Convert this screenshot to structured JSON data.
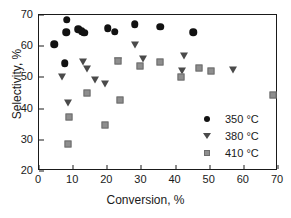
{
  "chart_data": {
    "type": "scatter",
    "title": "",
    "xlabel": "Conversion, %",
    "ylabel": "Selectivity, %",
    "xlim": [
      0,
      70
    ],
    "ylim": [
      20,
      70
    ],
    "xticks": [
      0,
      10,
      20,
      30,
      40,
      50,
      60,
      70
    ],
    "yticks": [
      20,
      30,
      40,
      50,
      60,
      70
    ],
    "grid": false,
    "legend_position": "lower-right-inside",
    "series": [
      {
        "name": "350 °C",
        "marker": "circle",
        "color": "#121212",
        "points": [
          {
            "x": 4.4,
            "y": 60.7
          },
          {
            "x": 7.6,
            "y": 54.6
          },
          {
            "x": 8.2,
            "y": 68.5
          },
          {
            "x": 8.0,
            "y": 64.5
          },
          {
            "x": 11.5,
            "y": 65.5
          },
          {
            "x": 12.5,
            "y": 64.8
          },
          {
            "x": 13.2,
            "y": 64.3
          },
          {
            "x": 20.2,
            "y": 65.8
          },
          {
            "x": 22.2,
            "y": 64.6
          },
          {
            "x": 28.0,
            "y": 67.1
          },
          {
            "x": 35.5,
            "y": 66.3
          },
          {
            "x": 45.2,
            "y": 64.4
          }
        ]
      },
      {
        "name": "380 °C",
        "marker": "triangle-down",
        "color": "#4a4a4a",
        "points": [
          {
            "x": 6.8,
            "y": 49.7
          },
          {
            "x": 8.5,
            "y": 41.5
          },
          {
            "x": 13.0,
            "y": 54.6
          },
          {
            "x": 14.2,
            "y": 52.3
          },
          {
            "x": 16.3,
            "y": 48.7
          },
          {
            "x": 19.2,
            "y": 47.7
          },
          {
            "x": 23.0,
            "y": 55.0
          },
          {
            "x": 28.2,
            "y": 60.0
          },
          {
            "x": 30.5,
            "y": 55.5
          },
          {
            "x": 41.8,
            "y": 51.8
          },
          {
            "x": 42.4,
            "y": 56.6
          },
          {
            "x": 56.8,
            "y": 51.9
          }
        ]
      },
      {
        "name": "410 °C",
        "marker": "square",
        "color": "#8e8e8e",
        "points": [
          {
            "x": 8.6,
            "y": 28.8
          },
          {
            "x": 8.7,
            "y": 37.3
          },
          {
            "x": 14.2,
            "y": 44.9
          },
          {
            "x": 19.2,
            "y": 34.9
          },
          {
            "x": 23.0,
            "y": 55.3
          },
          {
            "x": 23.8,
            "y": 42.7
          },
          {
            "x": 29.7,
            "y": 53.5
          },
          {
            "x": 35.5,
            "y": 54.9
          },
          {
            "x": 41.5,
            "y": 50.1
          },
          {
            "x": 46.8,
            "y": 52.9
          },
          {
            "x": 50.3,
            "y": 51.9
          },
          {
            "x": 68.5,
            "y": 44.5
          }
        ]
      }
    ],
    "legend": [
      {
        "label": "350 °C",
        "marker": "circle"
      },
      {
        "label": "380 °C",
        "marker": "triangle-down"
      },
      {
        "label": "410 °C",
        "marker": "square"
      }
    ]
  }
}
